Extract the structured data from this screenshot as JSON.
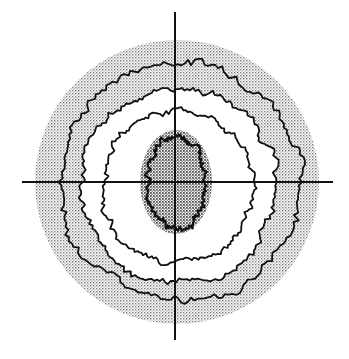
{
  "diagram": {
    "type": "visual-field-isopter-plot",
    "canvas": {
      "width": 349,
      "height": 359
    },
    "colors": {
      "background": "#ffffff",
      "ink": "#111111",
      "stipple": "#8a8a8a"
    },
    "axes": {
      "vertical": {
        "x": 175,
        "y1": 12,
        "y2": 340
      },
      "horizontal": {
        "y": 182,
        "x1": 22,
        "x2": 333
      }
    },
    "outer_field": {
      "cx": 177,
      "cy": 182,
      "r": 142,
      "fill": "stippled"
    },
    "isopters": [
      {
        "name": "isopter-outer",
        "r": 121,
        "jag": 6,
        "dx": 4,
        "dy": 0
      },
      {
        "name": "isopter-second",
        "r": 98,
        "jag": 5,
        "dx": 2,
        "dy": 4
      },
      {
        "name": "isopter-third",
        "r": 76,
        "jag": 4,
        "dx": 0,
        "dy": 4
      },
      {
        "name": "isopter-central",
        "rx": 30,
        "ry": 46,
        "jag": 4,
        "dx": 0,
        "dy": 0
      }
    ],
    "central_scotoma": {
      "cx": 176,
      "cy": 182,
      "rx": 36,
      "ry": 52,
      "fill": "dense-stippled"
    },
    "labels": []
  }
}
